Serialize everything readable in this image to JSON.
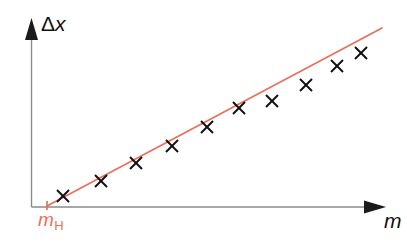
{
  "chart_data": {
    "type": "scatter",
    "title": "",
    "subtitle": "",
    "xlabel": "m",
    "ylabel": "Δx",
    "xlabel_style": "italic",
    "ylabel_style": "delta-upright-x-italic",
    "grid": false,
    "legend": false,
    "axis_ticks_labeled": false,
    "xlim": [
      0,
      100
    ],
    "ylim": [
      0,
      100
    ],
    "x": [
      8.5,
      18.0,
      28.5,
      39.0,
      50.0,
      59.5,
      69.0,
      78.5,
      87.5,
      95.5
    ],
    "y": [
      5.5,
      14.5,
      25.0,
      35.0,
      46.5,
      56.5,
      62.0,
      72.0,
      83.0,
      90.5
    ],
    "marker": "x",
    "marker_color": "#111111",
    "points": [
      {
        "px": 63,
        "py": 196
      },
      {
        "px": 101,
        "py": 181
      },
      {
        "px": 136,
        "py": 163
      },
      {
        "px": 172,
        "py": 146
      },
      {
        "px": 207,
        "py": 127
      },
      {
        "px": 239,
        "py": 108
      },
      {
        "px": 272,
        "py": 101
      },
      {
        "px": 306,
        "py": 85
      },
      {
        "px": 337,
        "py": 66
      },
      {
        "px": 361,
        "py": 53
      }
    ],
    "fit_line": {
      "label": "best-fit line",
      "color": "#e8705a",
      "x_intercept_px": 47,
      "start": {
        "px": 47,
        "py": 206
      },
      "end": {
        "px": 382,
        "py": 28
      }
    },
    "annotations": [
      {
        "name": "x-intercept",
        "text": "m_H",
        "base": "m",
        "subscript": "H",
        "color": "#e8705a",
        "px": 47,
        "py": 207
      }
    ]
  },
  "axes": {
    "y_axis": {
      "label_delta": "Δ",
      "label_variable": "x",
      "color": "#8a8a8a",
      "arrow_color": "#1a1a1a"
    },
    "x_axis": {
      "label": "m",
      "color": "#8a8a8a",
      "arrow_color": "#1a1a1a"
    }
  },
  "colors": {
    "background": "#ffffff",
    "axis": "#8a8a8a",
    "arrow": "#1a1a1a",
    "accent_red": "#e8705a",
    "marker": "#111111"
  }
}
